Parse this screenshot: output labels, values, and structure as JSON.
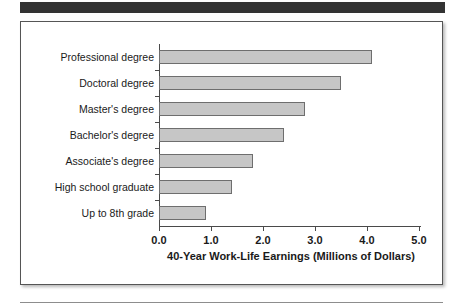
{
  "banner": {
    "label": "top-dark-banner"
  },
  "chart_data": {
    "type": "bar",
    "orientation": "horizontal",
    "title": "",
    "xlabel": "40-Year Work-Life Earnings (Millions of Dollars)",
    "ylabel": "",
    "categories": [
      "Professional degree",
      "Doctoral degree",
      "Master's degree",
      "Bachelor's degree",
      "Associate's degree",
      "High school graduate",
      "Up to 8th grade"
    ],
    "values": [
      4.1,
      3.5,
      2.8,
      2.4,
      1.8,
      1.4,
      0.9
    ],
    "xlim": [
      0.0,
      5.0
    ],
    "xticks": [
      "0.0",
      "1.0",
      "2.0",
      "3.0",
      "4.0",
      "5.0"
    ],
    "xtick_values": [
      0,
      1,
      2,
      3,
      4,
      5
    ],
    "grid": false,
    "legend": false,
    "bar_fill_color": "#c6c6c6",
    "bar_border_color": "#6e6e6e",
    "axis_color": "#4a4a4a",
    "text_color": "#1a1a1a"
  }
}
